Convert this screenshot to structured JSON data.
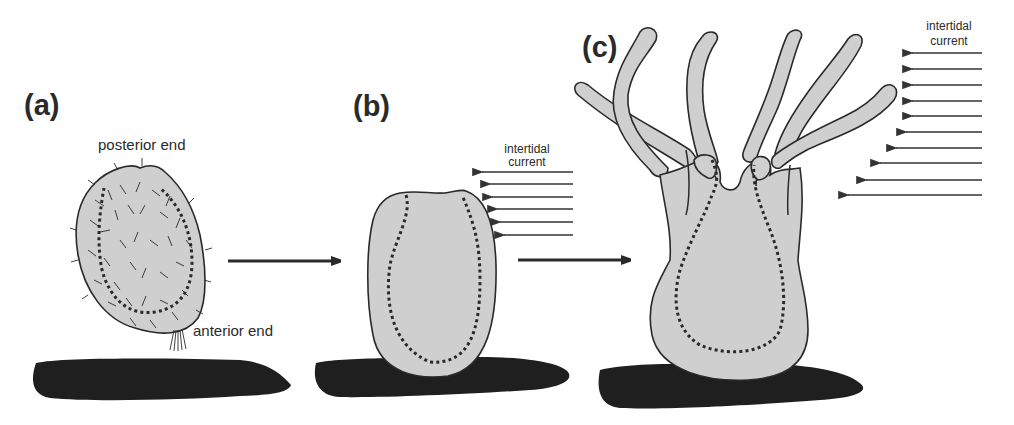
{
  "figure": {
    "panels": [
      {
        "id": "a",
        "label": "(a)",
        "annotations": {
          "top": "posterior end",
          "bottom": "anterior end"
        }
      },
      {
        "id": "b",
        "label": "(b)",
        "annotations": {
          "current_line1": "intertidal",
          "current_line2": "current"
        },
        "current_arrow_count": 6
      },
      {
        "id": "c",
        "label": "(c)",
        "annotations": {
          "current_line1": "intertidal",
          "current_line2": "current"
        },
        "current_arrow_count": 10,
        "tentacle_count": 6
      }
    ],
    "transition_arrows": [
      "a-to-b",
      "b-to-c"
    ],
    "colors": {
      "body_fill": "#cfcfcf",
      "outline": "#2a2a2a",
      "substrate": "#1f1f1f",
      "background": "#ffffff"
    }
  }
}
